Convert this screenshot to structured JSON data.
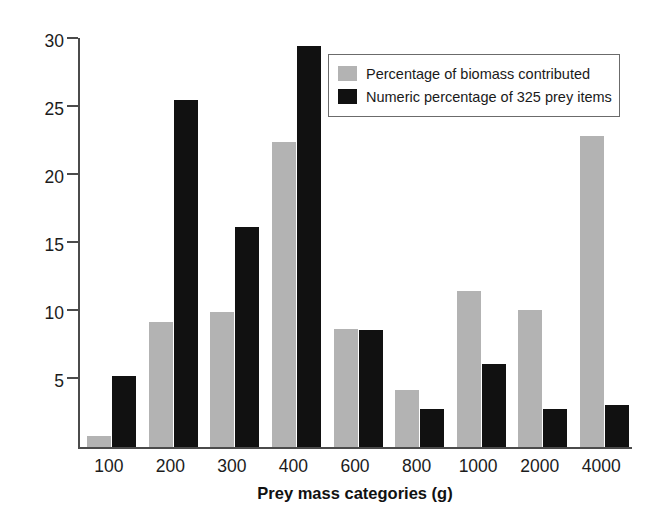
{
  "chart_data": {
    "type": "bar",
    "title": "",
    "xlabel": "Prey mass categories (g)",
    "ylabel": "Percentage",
    "categories": [
      "100",
      "200",
      "300",
      "400",
      "600",
      "800",
      "1000",
      "2000",
      "4000"
    ],
    "series": [
      {
        "name": "Percentage of biomass contributed",
        "color": "#b3b3b3",
        "values": [
          0.8,
          9.2,
          9.9,
          22.4,
          8.7,
          4.2,
          11.5,
          10.1,
          22.9
        ]
      },
      {
        "name": "Numeric percentage of 325 prey items",
        "color": "#111111",
        "values": [
          5.2,
          25.5,
          16.2,
          29.5,
          8.6,
          2.8,
          6.1,
          2.8,
          3.1
        ]
      }
    ],
    "ylim": [
      0,
      31
    ],
    "yticks": [
      5,
      10,
      15,
      20,
      25,
      30
    ],
    "ytick_labels": [
      "5",
      "10",
      "15",
      "20",
      "25",
      "30"
    ],
    "grid": false,
    "legend_position": "top-right"
  },
  "legend": {
    "entries": [
      {
        "label": "Percentage of biomass contributed",
        "swatch": "gray"
      },
      {
        "label": "Numeric percentage of 325 prey items",
        "swatch": "black"
      }
    ]
  }
}
